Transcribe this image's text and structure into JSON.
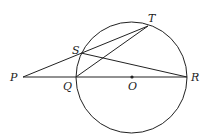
{
  "diagram": {
    "points": {
      "P": {
        "label": "P",
        "x": 23,
        "y": 77
      },
      "Q": {
        "label": "Q",
        "x": 76,
        "y": 77
      },
      "O": {
        "label": "O",
        "x": 132,
        "y": 77
      },
      "R": {
        "label": "R",
        "x": 187,
        "y": 77
      },
      "S": {
        "label": "S",
        "x": 81,
        "y": 53
      },
      "T": {
        "label": "T",
        "x": 148,
        "y": 26
      }
    },
    "circle": {
      "center": "O",
      "cx": 131.5,
      "cy": 77.5,
      "r": 55.5
    },
    "segments": [
      [
        "P",
        "R"
      ],
      [
        "P",
        "T"
      ],
      [
        "S",
        "R"
      ],
      [
        "Q",
        "T"
      ]
    ],
    "colors": {
      "stroke": "#222222",
      "background": "#ffffff"
    }
  }
}
